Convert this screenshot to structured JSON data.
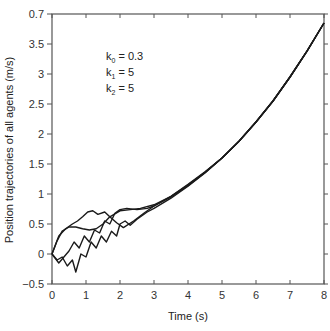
{
  "chart_data": {
    "type": "line",
    "title": "",
    "xlabel": "Time (s)",
    "ylabel": "Position trajectories of all agents (m/s)",
    "xlim": [
      0,
      8
    ],
    "ylim": [
      -0.5,
      4.0
    ],
    "xticks": [
      "0",
      "1",
      "2",
      "3",
      "4",
      "5",
      "6",
      "7",
      "8"
    ],
    "yticks": [
      {
        "value": -0.5,
        "label": "-0.5"
      },
      {
        "value": 0,
        "label": "0"
      },
      {
        "value": 0.5,
        "label": "0.5"
      },
      {
        "value": 1,
        "label": "1"
      },
      {
        "value": 1.5,
        "label": "1.5"
      },
      {
        "value": 2,
        "label": "2"
      },
      {
        "value": 2.5,
        "label": "2.5"
      },
      {
        "value": 3,
        "label": "3"
      },
      {
        "value": 3.5,
        "label": "3.5"
      },
      {
        "value": 4.0,
        "label": "0.7"
      }
    ],
    "grid": false,
    "box": true,
    "annotations": [
      "k0 = 0.3",
      "k1 = 5",
      "k2 = 5"
    ],
    "series": [
      {
        "name": "agent 1",
        "x": [
          0,
          0.15,
          0.3,
          0.5,
          0.7,
          0.9,
          1.1,
          1.3,
          1.5,
          1.7,
          2.0,
          2.3,
          2.6,
          3.0,
          3.5,
          4.0,
          4.5,
          5.0,
          5.5,
          6.0,
          6.5,
          7.0,
          7.5,
          8.0
        ],
        "y": [
          0,
          0.22,
          0.38,
          0.45,
          0.45,
          0.42,
          0.4,
          0.42,
          0.5,
          0.62,
          0.72,
          0.74,
          0.76,
          0.82,
          0.96,
          1.15,
          1.36,
          1.6,
          1.88,
          2.2,
          2.55,
          2.95,
          3.38,
          3.85
        ]
      },
      {
        "name": "agent 2",
        "x": [
          0,
          0.2,
          0.4,
          0.6,
          0.75,
          0.9,
          1.05,
          1.2,
          1.35,
          1.55,
          1.7,
          1.9,
          2.1,
          2.4,
          2.7,
          3.0,
          3.5,
          4.0,
          4.5,
          5.0,
          5.5,
          6.0,
          6.5,
          7.0,
          7.5,
          8.0
        ],
        "y": [
          0,
          0.3,
          0.42,
          0.5,
          0.55,
          0.62,
          0.7,
          0.72,
          0.66,
          0.7,
          0.62,
          0.52,
          0.44,
          0.55,
          0.68,
          0.8,
          0.95,
          1.14,
          1.36,
          1.6,
          1.88,
          2.2,
          2.55,
          2.95,
          3.38,
          3.85
        ]
      },
      {
        "name": "agent 3",
        "x": [
          0,
          0.15,
          0.3,
          0.45,
          0.6,
          0.7,
          0.85,
          1.0,
          1.15,
          1.3,
          1.45,
          1.6,
          1.75,
          1.9,
          2.0,
          2.15,
          2.3,
          2.5,
          2.8,
          3.0,
          3.5,
          4.0,
          4.5,
          5.0,
          5.5,
          6.0,
          6.5,
          7.0,
          7.5,
          8.0
        ],
        "y": [
          0,
          -0.1,
          -0.05,
          -0.2,
          -0.1,
          -0.3,
          0.0,
          -0.05,
          0.2,
          0.1,
          0.3,
          0.2,
          0.38,
          0.3,
          0.5,
          0.55,
          0.48,
          0.58,
          0.7,
          0.76,
          0.93,
          1.13,
          1.35,
          1.6,
          1.88,
          2.2,
          2.55,
          2.95,
          3.38,
          3.85
        ]
      },
      {
        "name": "agent 4",
        "x": [
          0,
          0.2,
          0.35,
          0.5,
          0.65,
          0.8,
          0.95,
          1.1,
          1.25,
          1.4,
          1.55,
          1.7,
          1.85,
          2.0,
          2.2,
          2.5,
          2.8,
          3.0,
          3.5,
          4.0,
          4.5,
          5.0,
          5.5,
          6.0,
          6.5,
          7.0,
          7.5,
          8.0
        ],
        "y": [
          0,
          -0.15,
          -0.05,
          0.05,
          0.2,
          0.1,
          0.3,
          0.2,
          0.4,
          0.35,
          0.55,
          0.5,
          0.68,
          0.74,
          0.76,
          0.74,
          0.76,
          0.8,
          0.96,
          1.16,
          1.37,
          1.6,
          1.88,
          2.2,
          2.55,
          2.95,
          3.38,
          3.85
        ]
      }
    ]
  }
}
